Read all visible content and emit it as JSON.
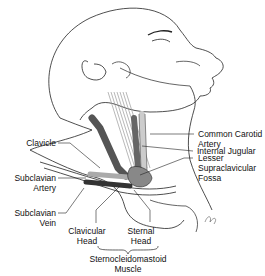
{
  "figure": {
    "labels": {
      "common_carotid_1": "Common Carotid",
      "common_carotid_2": "Artery",
      "internal_jugular": "Internal Jugular",
      "lesser_1": "Lesser",
      "lesser_2": "Supraclavicular",
      "lesser_3": "Fossa",
      "clavicle": "Clavicle",
      "subclavian_artery_1": "Subclavian",
      "subclavian_artery_2": "Artery",
      "subclavian_vein_1": "Subclavian",
      "subclavian_vein_2": "Vein",
      "clavicular_head_1": "Clavicular",
      "clavicular_head_2": "Head",
      "sternal_head_1": "Sternal",
      "sternal_head_2": "Head",
      "scm_1": "Sternocleidomastoid",
      "scm_2": "Muscle"
    },
    "colors": {
      "line": "#222222",
      "vein_dark": "#555555",
      "artery_light": "#bbbbbb",
      "muscle": "#999999"
    }
  }
}
